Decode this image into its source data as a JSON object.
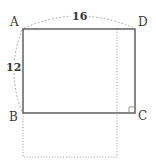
{
  "figure": {
    "colors": {
      "solid_stroke": "#555555",
      "dotted_stroke": "#9a9a9a",
      "text": "#3a3a3a",
      "background": "#ffffff"
    },
    "vertices": [
      {
        "name": "A",
        "label": "A",
        "position": "top-left",
        "x": 23,
        "y": 29
      },
      {
        "name": "D",
        "label": "D",
        "position": "top-right",
        "x": 135,
        "y": 29
      },
      {
        "name": "B",
        "label": "B",
        "position": "bottom-left",
        "x": 23,
        "y": 113
      },
      {
        "name": "C",
        "label": "C",
        "position": "bottom-right",
        "x": 135,
        "y": 113
      }
    ],
    "measurements": [
      {
        "name": "top-side",
        "label": "16",
        "edge": "AD",
        "value": 16
      },
      {
        "name": "left-side",
        "label": "12",
        "edge": "AB",
        "value": 12
      }
    ],
    "markers": [
      {
        "name": "right-angle-at-C",
        "at": "C",
        "type": "right-angle-square"
      }
    ],
    "construction_lines": [
      {
        "name": "vertical-dotted-guide",
        "from_x": 117,
        "from_y": 29,
        "to_x": 117,
        "to_y": 157
      },
      {
        "name": "dotted-square-below",
        "x": 23,
        "y": 113,
        "width": 94,
        "height": 44
      }
    ]
  }
}
